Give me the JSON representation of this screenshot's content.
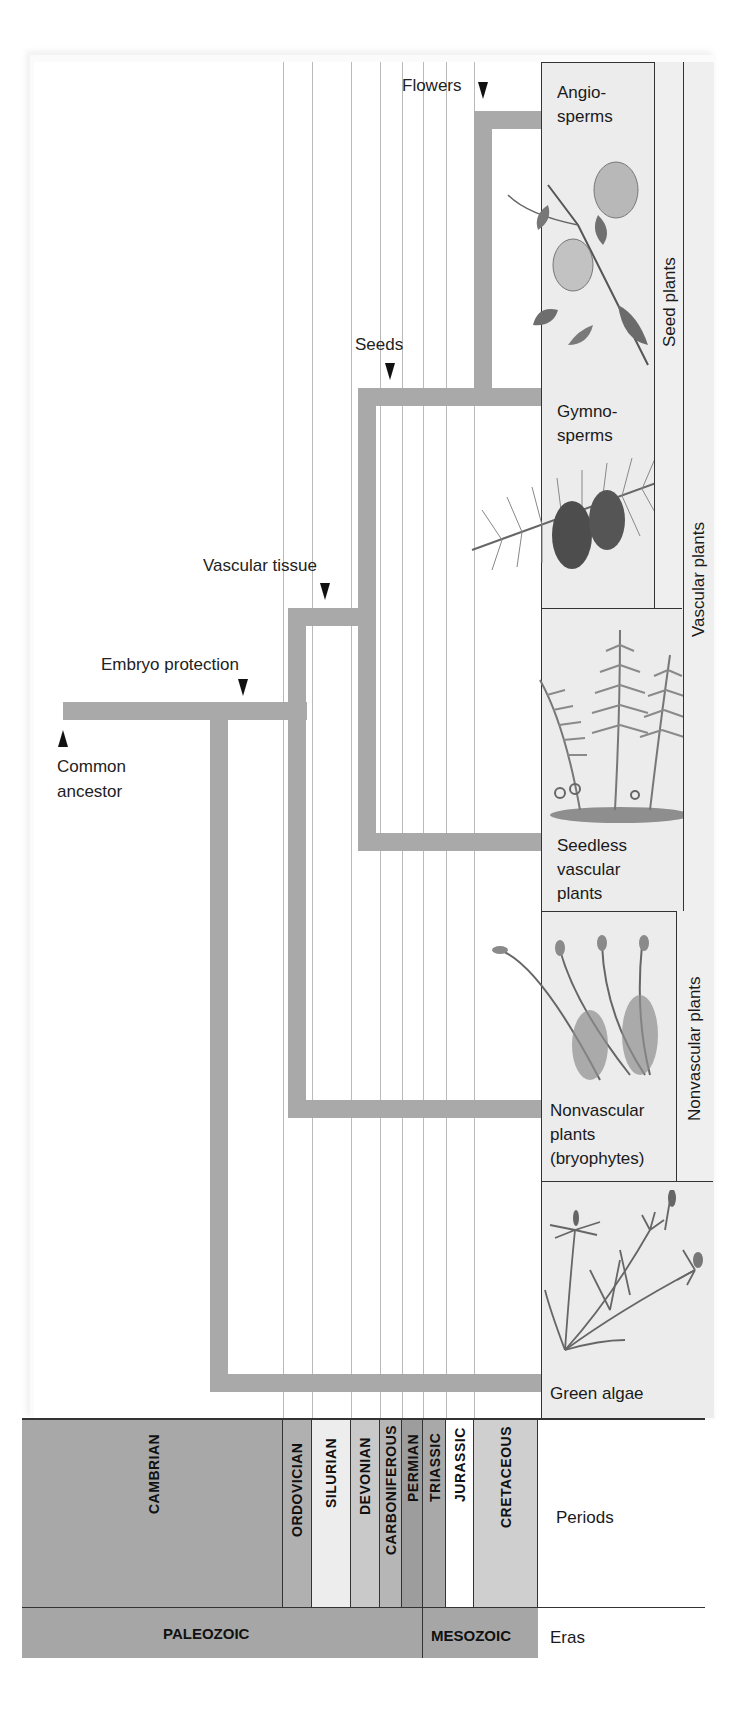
{
  "figure": {
    "type": "phylogenetic-tree",
    "trait_markers": [
      {
        "id": "flowers",
        "label": "Flowers"
      },
      {
        "id": "seeds",
        "label": "Seeds"
      },
      {
        "id": "vascular_tissue",
        "label": "Vascular tissue"
      },
      {
        "id": "embryo_protection",
        "label": "Embryo protection"
      }
    ],
    "root": {
      "label_line1": "Common",
      "label_line2": "ancestor"
    },
    "taxa": [
      {
        "id": "angiosperms",
        "line1": "Angio-",
        "line2": "sperms",
        "line3": ""
      },
      {
        "id": "gymnosperms",
        "line1": "Gymno-",
        "line2": "sperms",
        "line3": ""
      },
      {
        "id": "seedless_vascular",
        "line1": "Seedless",
        "line2": "vascular",
        "line3": "plants"
      },
      {
        "id": "nonvascular",
        "line1": "Nonvascular",
        "line2": "plants",
        "line3": "(bryophytes)"
      },
      {
        "id": "green_algae",
        "line1": "Green algae",
        "line2": "",
        "line3": ""
      }
    ],
    "groups": [
      {
        "id": "seed_plants",
        "label": "Seed plants"
      },
      {
        "id": "vascular_plants",
        "label": "Vascular plants"
      },
      {
        "id": "nonvascular_plants",
        "label": "Nonvascular plants"
      }
    ],
    "periods": [
      {
        "name": "CAMBRIAN",
        "color": "#a8a8a8"
      },
      {
        "name": "ORDOVICIAN",
        "color": "#b0b0b0"
      },
      {
        "name": "SILURIAN",
        "color": "#ededed"
      },
      {
        "name": "DEVONIAN",
        "color": "#c9c9c9"
      },
      {
        "name": "CARBONIFEROUS",
        "color": "#b6b6b6"
      },
      {
        "name": "PERMIAN",
        "color": "#9d9d9d"
      },
      {
        "name": "TRIASSIC",
        "color": "#a9a9a9"
      },
      {
        "name": "JURASSIC",
        "color": "#ffffff"
      },
      {
        "name": "CRETACEOUS",
        "color": "#cfcfcf"
      }
    ],
    "periods_label": "Periods",
    "eras": [
      {
        "name": "PALEOZOIC",
        "color": "#a6a6a6"
      },
      {
        "name": "MESOZOIC",
        "color": "#a6a6a6"
      }
    ],
    "eras_label": "Eras",
    "colors": {
      "branch": "#a9a9a9",
      "plant_panel": "#ececec",
      "grid_line": "#b9b9b9"
    }
  }
}
